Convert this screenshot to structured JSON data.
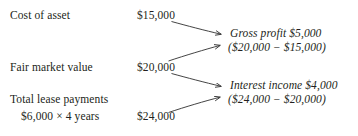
{
  "diagram": {
    "text_color": "#231f20",
    "background_color": "#ffffff",
    "arrow_color": "#3a3a3a",
    "rows": [
      {
        "label": "Cost of asset",
        "amount": "$15,000"
      },
      {
        "label": "Fair market value",
        "amount": "$20,000"
      },
      {
        "label": "Total lease payments",
        "sublabel": "$6,000 × 4 years",
        "amount": "$24,000"
      }
    ],
    "results": [
      {
        "line1": "Gross profit $5,000",
        "line2": "($20,000 − $15,000)"
      },
      {
        "line1": "Interest income $4,000",
        "line2": "($24,000 − $20,000)"
      }
    ],
    "arrows": [
      {
        "name": "arrow-cost-to-gross-profit",
        "from": "Cost of asset $15,000",
        "to": "Gross profit $5,000"
      },
      {
        "name": "arrow-fmv-to-gross-profit",
        "from": "Fair market value $20,000",
        "to": "($20,000 − $15,000)"
      },
      {
        "name": "arrow-fmv-to-interest-income",
        "from": "Fair market value $20,000",
        "to": "Interest income $4,000"
      },
      {
        "name": "arrow-lease-payments-to-interest-income",
        "from": "Total lease payments $24,000",
        "to": "($24,000 − $20,000)"
      }
    ]
  }
}
